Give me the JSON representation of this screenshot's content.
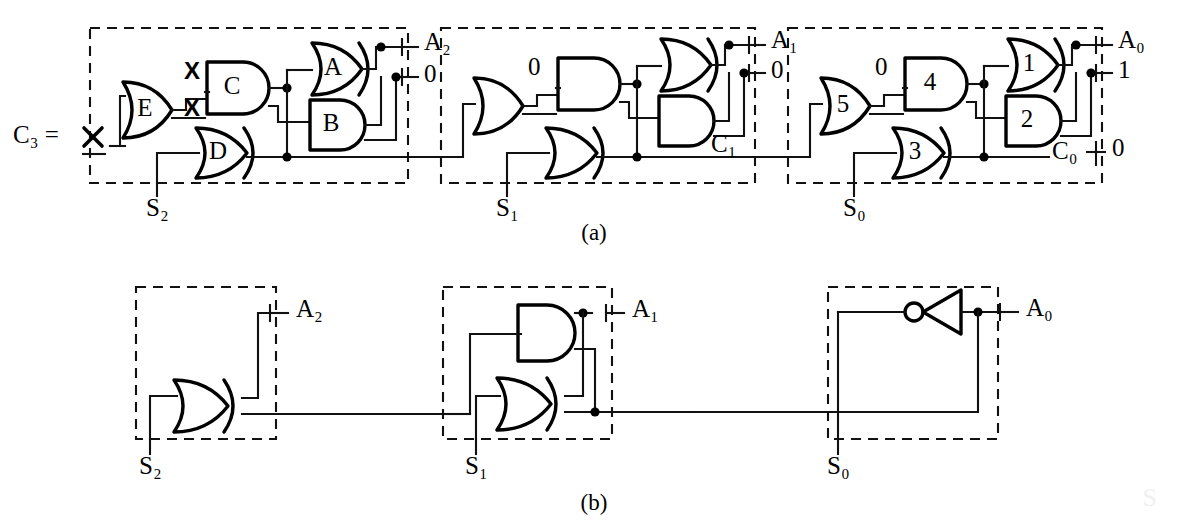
{
  "figure": {
    "caption_a": "(a)",
    "caption_b": "(b)",
    "watermark": "S"
  },
  "part_a": {
    "input_label": "C₃ =",
    "input_mark": "X",
    "blocks": [
      {
        "name": "block-s2",
        "stage_label": "S₂",
        "gates": [
          "E",
          "C",
          "A",
          "B",
          "D"
        ],
        "annotations": [
          "X",
          "X"
        ],
        "outputs": [
          {
            "label": "A₂"
          },
          {
            "label": "0"
          }
        ]
      },
      {
        "name": "block-s1",
        "stage_label": "S₁",
        "gates": [
          "",
          "",
          "",
          "",
          ""
        ],
        "annotations": [
          "0"
        ],
        "outputs": [
          {
            "label": "A₁"
          },
          {
            "label": "0"
          },
          {
            "label": "C₁"
          }
        ]
      },
      {
        "name": "block-s0",
        "stage_label": "S₀",
        "gates": [
          "5",
          "4",
          "1",
          "2",
          "3"
        ],
        "annotations": [
          "0"
        ],
        "outputs": [
          {
            "label": "A₀"
          },
          {
            "label": "1"
          },
          {
            "label": "C₀",
            "value": "0"
          }
        ]
      }
    ]
  },
  "part_b": {
    "blocks": [
      {
        "name": "block-s2",
        "stage_label": "S₂",
        "gates": [
          "xor"
        ],
        "outputs": [
          {
            "label": "A₂"
          }
        ]
      },
      {
        "name": "block-s1",
        "stage_label": "S₁",
        "gates": [
          "and",
          "xor"
        ],
        "outputs": [
          {
            "label": "A₁"
          }
        ]
      },
      {
        "name": "block-s0",
        "stage_label": "S₀",
        "gates": [
          "not"
        ],
        "outputs": [
          {
            "label": "A₀"
          }
        ]
      }
    ]
  },
  "colors": {
    "ink": "#111111",
    "paper": "#ffffff"
  }
}
